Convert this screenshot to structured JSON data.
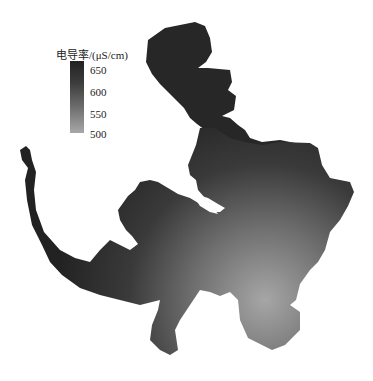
{
  "legend": {
    "title": "电导率/(μS/cm)",
    "ticks": [
      {
        "label": "650",
        "pos": 0.0
      },
      {
        "label": "600",
        "pos": 0.31
      },
      {
        "label": "550",
        "pos": 0.61
      },
      {
        "label": "500",
        "pos": 0.89
      }
    ],
    "color_high": "#222222",
    "color_low": "#a8a8a8"
  },
  "map": {
    "variable": "电导率",
    "unit": "μS/cm",
    "value_range": [
      480,
      660
    ],
    "high_region": "north and west (dark)",
    "low_region": "southeast (light)"
  }
}
